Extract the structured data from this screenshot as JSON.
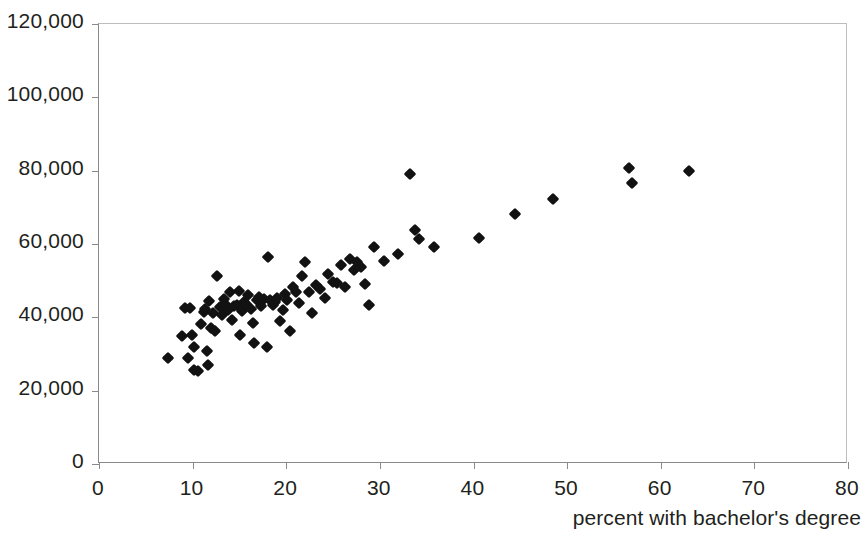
{
  "chart_data": {
    "type": "scatter",
    "title": "",
    "subtitle": "",
    "xlabel": "percent with bachelor's degree",
    "ylabel": "",
    "xlim": [
      0,
      80
    ],
    "ylim": [
      0,
      120000
    ],
    "grid": false,
    "legend": null,
    "marker_style": "diamond",
    "marker_color": "#121212",
    "axis_color": "#8a8a8a",
    "text_color": "#231f20",
    "background_color": "#ffffff",
    "x_ticks": [
      {
        "value": 0,
        "label": "0"
      },
      {
        "value": 10,
        "label": "10"
      },
      {
        "value": 20,
        "label": "20"
      },
      {
        "value": 30,
        "label": "30"
      },
      {
        "value": 40,
        "label": "40"
      },
      {
        "value": 50,
        "label": "50"
      },
      {
        "value": 60,
        "label": "60"
      },
      {
        "value": 70,
        "label": "70"
      },
      {
        "value": 80,
        "label": "80"
      }
    ],
    "y_ticks": [
      {
        "value": 0,
        "label": "0"
      },
      {
        "value": 20000,
        "label": "20,000"
      },
      {
        "value": 40000,
        "label": "40,000"
      },
      {
        "value": 60000,
        "label": "60,000"
      },
      {
        "value": 80000,
        "label": "80,000"
      },
      {
        "value": 100000,
        "label": "100,000"
      },
      {
        "value": 120000,
        "label": "120,000"
      }
    ],
    "points": [
      {
        "x": 7.4,
        "y": 29000
      },
      {
        "x": 8.9,
        "y": 34900
      },
      {
        "x": 9.2,
        "y": 42600
      },
      {
        "x": 9.5,
        "y": 29000
      },
      {
        "x": 9.7,
        "y": 42500
      },
      {
        "x": 9.9,
        "y": 35300
      },
      {
        "x": 10.1,
        "y": 31800
      },
      {
        "x": 10.2,
        "y": 25600
      },
      {
        "x": 10.6,
        "y": 25400
      },
      {
        "x": 10.9,
        "y": 38300
      },
      {
        "x": 11.2,
        "y": 41500
      },
      {
        "x": 11.3,
        "y": 42300
      },
      {
        "x": 11.5,
        "y": 30900
      },
      {
        "x": 11.6,
        "y": 27100
      },
      {
        "x": 11.8,
        "y": 44500
      },
      {
        "x": 12.0,
        "y": 37100
      },
      {
        "x": 12.2,
        "y": 41300
      },
      {
        "x": 12.4,
        "y": 36300
      },
      {
        "x": 12.6,
        "y": 51300
      },
      {
        "x": 12.9,
        "y": 42700
      },
      {
        "x": 13.1,
        "y": 40700
      },
      {
        "x": 13.3,
        "y": 44900
      },
      {
        "x": 13.5,
        "y": 43600
      },
      {
        "x": 13.8,
        "y": 41900
      },
      {
        "x": 14.0,
        "y": 46900
      },
      {
        "x": 14.2,
        "y": 39200
      },
      {
        "x": 14.4,
        "y": 43000
      },
      {
        "x": 14.7,
        "y": 43300
      },
      {
        "x": 14.9,
        "y": 47300
      },
      {
        "x": 15.1,
        "y": 35200
      },
      {
        "x": 15.3,
        "y": 41800
      },
      {
        "x": 15.5,
        "y": 44200
      },
      {
        "x": 15.7,
        "y": 43600
      },
      {
        "x": 15.9,
        "y": 46100
      },
      {
        "x": 16.2,
        "y": 42400
      },
      {
        "x": 16.4,
        "y": 38400
      },
      {
        "x": 16.6,
        "y": 33100
      },
      {
        "x": 16.9,
        "y": 44700
      },
      {
        "x": 17.1,
        "y": 45600
      },
      {
        "x": 17.3,
        "y": 43100
      },
      {
        "x": 17.6,
        "y": 45000
      },
      {
        "x": 17.9,
        "y": 31900
      },
      {
        "x": 18.1,
        "y": 56500
      },
      {
        "x": 18.3,
        "y": 44800
      },
      {
        "x": 18.6,
        "y": 43300
      },
      {
        "x": 18.8,
        "y": 44100
      },
      {
        "x": 19.0,
        "y": 45400
      },
      {
        "x": 19.3,
        "y": 39000
      },
      {
        "x": 19.6,
        "y": 42000
      },
      {
        "x": 19.9,
        "y": 46300
      },
      {
        "x": 20.1,
        "y": 44600
      },
      {
        "x": 20.4,
        "y": 36200
      },
      {
        "x": 20.7,
        "y": 48300
      },
      {
        "x": 21.0,
        "y": 46800
      },
      {
        "x": 21.4,
        "y": 43900
      },
      {
        "x": 21.7,
        "y": 51200
      },
      {
        "x": 22.0,
        "y": 55200
      },
      {
        "x": 22.4,
        "y": 46800
      },
      {
        "x": 22.8,
        "y": 41200
      },
      {
        "x": 23.2,
        "y": 48800
      },
      {
        "x": 23.6,
        "y": 47600
      },
      {
        "x": 24.1,
        "y": 45200
      },
      {
        "x": 24.5,
        "y": 51900
      },
      {
        "x": 25.0,
        "y": 49600
      },
      {
        "x": 25.4,
        "y": 49300
      },
      {
        "x": 25.9,
        "y": 54400
      },
      {
        "x": 26.3,
        "y": 48300
      },
      {
        "x": 26.8,
        "y": 55800
      },
      {
        "x": 27.2,
        "y": 52800
      },
      {
        "x": 27.6,
        "y": 55000
      },
      {
        "x": 28.0,
        "y": 53600
      },
      {
        "x": 28.4,
        "y": 49200
      },
      {
        "x": 28.8,
        "y": 43300
      },
      {
        "x": 29.4,
        "y": 59100
      },
      {
        "x": 30.4,
        "y": 55400
      },
      {
        "x": 31.9,
        "y": 57200
      },
      {
        "x": 33.2,
        "y": 79000
      },
      {
        "x": 33.8,
        "y": 63700
      },
      {
        "x": 34.2,
        "y": 61500
      },
      {
        "x": 35.8,
        "y": 59300
      },
      {
        "x": 40.6,
        "y": 61700
      },
      {
        "x": 44.4,
        "y": 68100
      },
      {
        "x": 48.5,
        "y": 72300
      },
      {
        "x": 56.6,
        "y": 80800
      },
      {
        "x": 56.9,
        "y": 76700
      },
      {
        "x": 63.0,
        "y": 79800
      }
    ]
  }
}
